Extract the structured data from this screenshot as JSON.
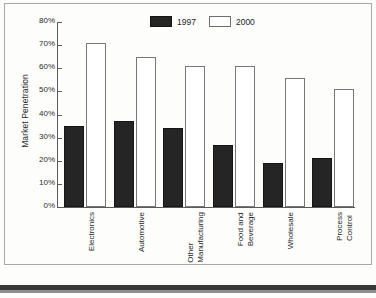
{
  "chart_data": {
    "type": "bar",
    "title": "",
    "xlabel": "",
    "ylabel": "Market Penetration",
    "ylim": [
      0,
      80
    ],
    "ytick_labels": [
      "80%",
      "70%",
      "60%",
      "50%",
      "40%",
      "30%",
      "20%",
      "10%",
      "0%"
    ],
    "ytick_values": [
      80,
      70,
      60,
      50,
      40,
      30,
      20,
      10,
      0
    ],
    "grid": false,
    "legend_position": "top-center",
    "categories": [
      "Electronics",
      "Automotive",
      "Other Manufacturing",
      "Food and Beverage",
      "Wholesale",
      "Process Control"
    ],
    "category_lines": [
      [
        "Electronics"
      ],
      [
        "Automotive"
      ],
      [
        "Other",
        "Manufacturing"
      ],
      [
        "Food and",
        "Beverage"
      ],
      [
        "Wholesale"
      ],
      [
        "Process",
        "Control"
      ]
    ],
    "series": [
      {
        "name": "1997",
        "color": "#252525",
        "values": [
          35,
          37,
          34,
          27,
          19,
          21
        ]
      },
      {
        "name": "2000",
        "color": "#ffffff",
        "values": [
          71,
          65,
          61,
          61,
          56,
          51
        ]
      }
    ]
  },
  "legend": {
    "items": [
      {
        "label": "1997"
      },
      {
        "label": "2000"
      }
    ]
  }
}
